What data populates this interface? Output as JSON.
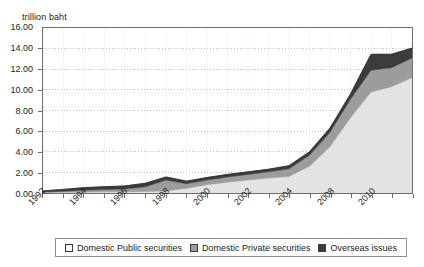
{
  "chart_data": {
    "type": "area",
    "stacked": true,
    "title": "",
    "subtitle": "",
    "xlabel": "",
    "ylabel": "trillion baht",
    "unit_label": "trillion baht",
    "grid": true,
    "gridline_style": "dotted-horizontal",
    "legend_position": "bottom",
    "ylim": [
      0,
      16
    ],
    "ytick_step": 2,
    "ytick_labels": [
      "16.00",
      "14.00",
      "12.00",
      "10.00",
      "8.00",
      "6.00",
      "4.00",
      "2.00",
      "0.00"
    ],
    "ytick_values": [
      16,
      14,
      12,
      10,
      8,
      6,
      4,
      2,
      0
    ],
    "x": [
      1992,
      1993,
      1994,
      1995,
      1996,
      1997,
      1998,
      1999,
      2000,
      2001,
      2002,
      2003,
      2004,
      2005,
      2006,
      2007,
      2008,
      2009,
      2010
    ],
    "xtick_labels": [
      "1992",
      "",
      "1994",
      "",
      "1996",
      "",
      "1998",
      "",
      "2000",
      "",
      "2002",
      "",
      "2004",
      "",
      "2008",
      "",
      "2010",
      "",
      ""
    ],
    "xtick_labels_shown": [
      "1992",
      "1994",
      "1996",
      "1998",
      "2000",
      "2002",
      "2004",
      "2008",
      "2010"
    ],
    "xtick_label_rotation_deg": -45,
    "series": [
      {
        "name": "Domestic Public securities",
        "color": "#e3e3e3",
        "values": [
          0.05,
          0.07,
          0.09,
          0.11,
          0.13,
          0.15,
          0.2,
          0.45,
          0.8,
          1.05,
          1.25,
          1.45,
          1.6,
          2.6,
          4.5,
          7.3,
          9.8,
          10.3,
          11.2
        ]
      },
      {
        "name": "Domestic Private securities",
        "color": "#9c9c9c",
        "values": [
          0.05,
          0.1,
          0.18,
          0.22,
          0.25,
          0.45,
          1.05,
          0.45,
          0.45,
          0.5,
          0.55,
          0.6,
          0.75,
          1.05,
          1.4,
          1.8,
          2.1,
          1.85,
          1.9
        ]
      },
      {
        "name": "Overseas issues",
        "color": "#3c3c3c",
        "values": [
          0.1,
          0.18,
          0.25,
          0.28,
          0.3,
          0.35,
          0.3,
          0.25,
          0.25,
          0.25,
          0.25,
          0.25,
          0.3,
          0.35,
          0.4,
          0.5,
          1.55,
          1.3,
          0.95
        ]
      }
    ],
    "totals": [
      0.2,
      0.35,
      0.52,
      0.61,
      0.68,
      0.95,
      1.55,
      1.15,
      1.5,
      1.8,
      2.05,
      2.3,
      2.65,
      4.0,
      6.3,
      9.6,
      13.45,
      13.45,
      14.05
    ]
  },
  "legend": {
    "items": [
      {
        "label": "Domestic Public securities",
        "swatch": "#ffffff",
        "swatch_name": "legend-swatch-domestic-public"
      },
      {
        "label": "Domestic Private securities",
        "swatch": "#9c9c9c",
        "swatch_name": "legend-swatch-domestic-private"
      },
      {
        "label": "Overseas issues",
        "swatch": "#3c3c3c",
        "swatch_name": "legend-swatch-overseas-issues"
      }
    ]
  },
  "colors": {
    "domestic_public": "#e3e3e3",
    "domestic_private": "#9c9c9c",
    "overseas_issues": "#3c3c3c",
    "axis": "#6e6e6e",
    "grid": "#b9b9b9",
    "text": "#1a1a1a",
    "background": "#ffffff"
  }
}
